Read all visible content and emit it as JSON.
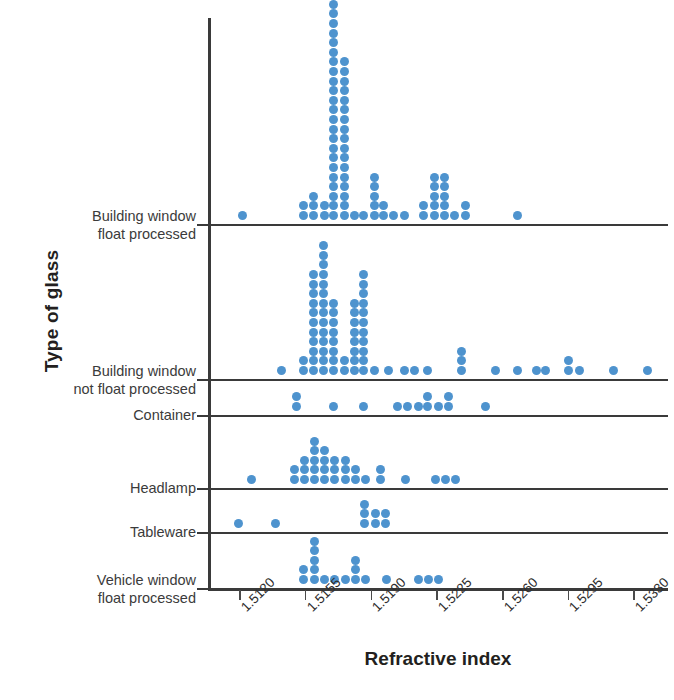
{
  "axes": {
    "x_title": "Refractive index",
    "y_title": "Type of glass",
    "x_ticks": [
      "1.5120",
      "1.5155",
      "1.5190",
      "1.5225",
      "1.5260",
      "1.5295",
      "1.5330"
    ]
  },
  "groups": [
    {
      "id": "building-window-float-processed",
      "label": "Building window\nfloat processed"
    },
    {
      "id": "building-window-not-float-processed",
      "label": "Building window\nnot float processed"
    },
    {
      "id": "container",
      "label": "Container"
    },
    {
      "id": "headlamp",
      "label": "Headlamp"
    },
    {
      "id": "tableware",
      "label": "Tableware"
    },
    {
      "id": "vehicle-window-float-processed",
      "label": "Vehicle window\nfloat processed"
    }
  ],
  "chart_data": {
    "type": "scatter",
    "plot_style": "dot-plot",
    "title": "",
    "xlabel": "Refractive index",
    "ylabel": "Type of glass",
    "xlim": [
      1.5103,
      1.5348
    ],
    "xticks": [
      1.512,
      1.5155,
      1.519,
      1.5225,
      1.526,
      1.5295,
      1.533
    ],
    "grid": false,
    "legend": false,
    "dot_color": "#4E93CE",
    "axis_color": "#3A3A3A",
    "categories": [
      "Building window float processed",
      "Building window not float processed",
      "Container",
      "Headlamp",
      "Tableware",
      "Vehicle window float processed"
    ],
    "series": [
      {
        "name": "Building window float processed",
        "stacks": [
          {
            "x": 1.51215,
            "count": 1
          },
          {
            "x": 1.5154,
            "count": 2
          },
          {
            "x": 1.5159,
            "count": 3
          },
          {
            "x": 1.5165,
            "count": 2
          },
          {
            "x": 1.517,
            "count": 24
          },
          {
            "x": 1.51755,
            "count": 17
          },
          {
            "x": 1.5181,
            "count": 1
          },
          {
            "x": 1.5186,
            "count": 1
          },
          {
            "x": 1.51915,
            "count": 5
          },
          {
            "x": 1.51965,
            "count": 2
          },
          {
            "x": 1.5202,
            "count": 1
          },
          {
            "x": 1.52075,
            "count": 1
          },
          {
            "x": 1.5218,
            "count": 2
          },
          {
            "x": 1.52235,
            "count": 5
          },
          {
            "x": 1.5229,
            "count": 5
          },
          {
            "x": 1.52345,
            "count": 1
          },
          {
            "x": 1.524,
            "count": 2
          },
          {
            "x": 1.5268,
            "count": 1
          }
        ]
      },
      {
        "name": "Building window not float processed",
        "stacks": [
          {
            "x": 1.5142,
            "count": 1
          },
          {
            "x": 1.5154,
            "count": 2
          },
          {
            "x": 1.5159,
            "count": 11
          },
          {
            "x": 1.51645,
            "count": 14
          },
          {
            "x": 1.517,
            "count": 8
          },
          {
            "x": 1.51755,
            "count": 2
          },
          {
            "x": 1.5181,
            "count": 8
          },
          {
            "x": 1.5186,
            "count": 11
          },
          {
            "x": 1.51915,
            "count": 1
          },
          {
            "x": 1.5199,
            "count": 1
          },
          {
            "x": 1.52075,
            "count": 1
          },
          {
            "x": 1.5213,
            "count": 1
          },
          {
            "x": 1.522,
            "count": 1
          },
          {
            "x": 1.5238,
            "count": 3
          },
          {
            "x": 1.5256,
            "count": 1
          },
          {
            "x": 1.5268,
            "count": 1
          },
          {
            "x": 1.5278,
            "count": 1
          },
          {
            "x": 1.5283,
            "count": 1
          },
          {
            "x": 1.5295,
            "count": 2
          },
          {
            "x": 1.5301,
            "count": 1
          },
          {
            "x": 1.5319,
            "count": 1
          },
          {
            "x": 1.5337,
            "count": 1
          }
        ]
      },
      {
        "name": "Container",
        "stacks": [
          {
            "x": 1.515,
            "count": 2
          },
          {
            "x": 1.517,
            "count": 1
          },
          {
            "x": 1.5186,
            "count": 1
          },
          {
            "x": 1.5204,
            "count": 1
          },
          {
            "x": 1.5209,
            "count": 1
          },
          {
            "x": 1.5215,
            "count": 1
          },
          {
            "x": 1.522,
            "count": 2
          },
          {
            "x": 1.52255,
            "count": 1
          },
          {
            "x": 1.5231,
            "count": 2
          },
          {
            "x": 1.5251,
            "count": 1
          }
        ]
      },
      {
        "name": "Headlamp",
        "stacks": [
          {
            "x": 1.5126,
            "count": 1
          },
          {
            "x": 1.5149,
            "count": 2
          },
          {
            "x": 1.51545,
            "count": 3
          },
          {
            "x": 1.51595,
            "count": 5
          },
          {
            "x": 1.5165,
            "count": 4
          },
          {
            "x": 1.51705,
            "count": 3
          },
          {
            "x": 1.5176,
            "count": 3
          },
          {
            "x": 1.51815,
            "count": 2
          },
          {
            "x": 1.5187,
            "count": 1
          },
          {
            "x": 1.5195,
            "count": 2
          },
          {
            "x": 1.5208,
            "count": 1
          },
          {
            "x": 1.5224,
            "count": 1
          },
          {
            "x": 1.52295,
            "count": 1
          },
          {
            "x": 1.5235,
            "count": 1
          }
        ]
      },
      {
        "name": "Tableware",
        "stacks": [
          {
            "x": 1.5119,
            "count": 1
          },
          {
            "x": 1.5139,
            "count": 1
          },
          {
            "x": 1.51865,
            "count": 3
          },
          {
            "x": 1.5192,
            "count": 2
          },
          {
            "x": 1.51975,
            "count": 2
          }
        ]
      },
      {
        "name": "Vehicle window float processed",
        "stacks": [
          {
            "x": 1.5154,
            "count": 2
          },
          {
            "x": 1.51595,
            "count": 5
          },
          {
            "x": 1.5165,
            "count": 1
          },
          {
            "x": 1.51705,
            "count": 1
          },
          {
            "x": 1.5176,
            "count": 1
          },
          {
            "x": 1.51815,
            "count": 3
          },
          {
            "x": 1.5187,
            "count": 1
          },
          {
            "x": 1.5198,
            "count": 1
          },
          {
            "x": 1.5215,
            "count": 1
          },
          {
            "x": 1.52205,
            "count": 1
          },
          {
            "x": 1.5226,
            "count": 1
          }
        ]
      }
    ]
  }
}
